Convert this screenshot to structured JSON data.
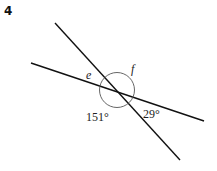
{
  "question_number": "4",
  "diagram": {
    "labels": {
      "e": "e",
      "f": "f",
      "angle_151": "151°",
      "angle_29": "29°"
    },
    "angles": [
      {
        "name": "e",
        "value": null
      },
      {
        "name": "f",
        "value": null
      },
      {
        "name": "bottom-left",
        "value": 151
      },
      {
        "name": "bottom-right",
        "value": 29
      }
    ],
    "colors": {
      "line": "#111111",
      "arc": "#555555",
      "text": "#222222"
    }
  }
}
